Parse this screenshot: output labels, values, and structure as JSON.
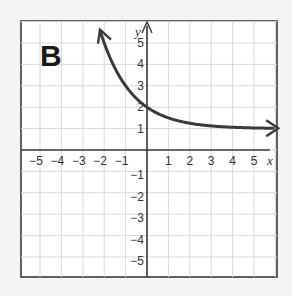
{
  "panel_label": "B",
  "colors": {
    "background": "#f4f4f3",
    "plot_bg": "#ffffff",
    "grid": "#d8d8d8",
    "axis": "#3a3a3a",
    "curve": "#3a3a3a"
  },
  "chart_data": {
    "type": "line",
    "title": "B",
    "xlabel": "x",
    "ylabel": "y",
    "xlim": [
      -5.8,
      6.2
    ],
    "ylim": [
      -5.8,
      6.2
    ],
    "grid": true,
    "x_ticks": [
      "-5",
      "-4",
      "-3",
      "-2",
      "-1",
      "1",
      "2",
      "3",
      "4",
      "5"
    ],
    "y_ticks": [
      "5",
      "4",
      "3",
      "2",
      "1",
      "-1",
      "-2",
      "-3",
      "-4",
      "-5"
    ],
    "series": [
      {
        "name": "y = 2^(-x) + 1",
        "x": [
          -2.2,
          -2,
          -1.5,
          -1,
          -0.5,
          0,
          0.5,
          1,
          1.5,
          2,
          3,
          4,
          5,
          6
        ],
        "values": [
          5.6,
          5,
          3.83,
          3,
          2.41,
          2,
          1.71,
          1.5,
          1.35,
          1.25,
          1.13,
          1.06,
          1.03,
          1.02
        ],
        "arrows": "both ends",
        "asymptote": 1
      }
    ]
  }
}
